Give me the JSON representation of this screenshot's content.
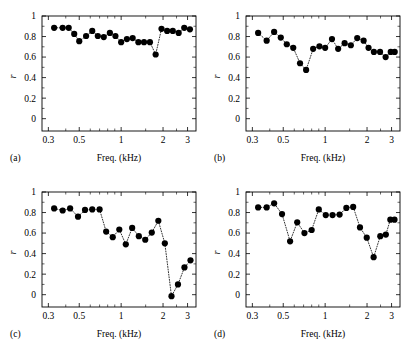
{
  "figure": {
    "panel_count": 4,
    "marker_color": "#000000",
    "line_style": "dotted",
    "background": "#ffffff"
  },
  "axes": {
    "xlabel": "Freq. (kHz)",
    "ylabel": "r",
    "x_scale": "log",
    "x_tick_labels": [
      "0.3",
      "0.5",
      "1",
      "2",
      "3"
    ],
    "x_tick_values": [
      0.3,
      0.5,
      1,
      2,
      3
    ],
    "x_minor_values": [
      0.4,
      0.6,
      0.7,
      0.8,
      0.9,
      1.5,
      2.5
    ],
    "y_tick_labels": [
      "0",
      "0.2",
      "0.4",
      "0.6",
      "0.8",
      "1"
    ],
    "y_tick_values": [
      0,
      0.2,
      0.4,
      0.6,
      0.8,
      1
    ],
    "xlim": [
      0.27,
      3.45
    ],
    "ylim": [
      -0.12,
      1.0
    ],
    "grid": false
  },
  "panels": [
    {
      "tag": "(a)",
      "name": "panel-a"
    },
    {
      "tag": "(b)",
      "name": "panel-b"
    },
    {
      "tag": "(c)",
      "name": "panel-c"
    },
    {
      "tag": "(d)",
      "name": "panel-d"
    }
  ],
  "chart_data": [
    {
      "type": "scatter",
      "title": "(a)",
      "xlabel": "Freq. (kHz)",
      "ylabel": "r",
      "xscale": "log",
      "xlim": [
        0.27,
        3.45
      ],
      "ylim": [
        -0.12,
        1.0
      ],
      "grid": false,
      "series": [
        {
          "name": "r-vs-frequency-a",
          "x": [
            0.33,
            0.38,
            0.42,
            0.46,
            0.5,
            0.56,
            0.62,
            0.68,
            0.75,
            0.83,
            0.91,
            1.0,
            1.1,
            1.21,
            1.33,
            1.46,
            1.61,
            1.77,
            1.95,
            2.14,
            2.35,
            2.59,
            2.84,
            3.12
          ],
          "y": [
            0.885,
            0.885,
            0.885,
            0.825,
            0.755,
            0.805,
            0.855,
            0.805,
            0.795,
            0.835,
            0.805,
            0.745,
            0.775,
            0.785,
            0.745,
            0.745,
            0.745,
            0.625,
            0.875,
            0.855,
            0.855,
            0.835,
            0.885,
            0.87
          ]
        }
      ]
    },
    {
      "type": "scatter",
      "title": "(b)",
      "xlabel": "Freq. (kHz)",
      "ylabel": "r",
      "xscale": "log",
      "xlim": [
        0.27,
        3.45
      ],
      "ylim": [
        -0.12,
        1.0
      ],
      "grid": false,
      "series": [
        {
          "name": "r-vs-frequency-b",
          "x": [
            0.33,
            0.38,
            0.43,
            0.48,
            0.53,
            0.59,
            0.66,
            0.73,
            0.82,
            0.91,
            1.0,
            1.12,
            1.24,
            1.38,
            1.53,
            1.7,
            1.89,
            2.05,
            2.24,
            2.48,
            2.72,
            2.96,
            3.16
          ],
          "y": [
            0.835,
            0.76,
            0.845,
            0.79,
            0.725,
            0.69,
            0.54,
            0.475,
            0.68,
            0.705,
            0.69,
            0.775,
            0.68,
            0.735,
            0.715,
            0.785,
            0.76,
            0.69,
            0.65,
            0.65,
            0.6,
            0.65,
            0.65
          ]
        }
      ]
    },
    {
      "type": "scatter",
      "title": "(c)",
      "xlabel": "Freq. (kHz)",
      "ylabel": "r",
      "xscale": "log",
      "xlim": [
        0.27,
        3.45
      ],
      "ylim": [
        -0.12,
        1.0
      ],
      "grid": false,
      "series": [
        {
          "name": "r-vs-frequency-c",
          "x": [
            0.33,
            0.38,
            0.43,
            0.49,
            0.55,
            0.62,
            0.7,
            0.78,
            0.87,
            0.97,
            1.08,
            1.2,
            1.34,
            1.49,
            1.66,
            1.85,
            2.06,
            2.3,
            2.56,
            2.85,
            3.15
          ],
          "y": [
            0.84,
            0.82,
            0.84,
            0.76,
            0.825,
            0.83,
            0.83,
            0.615,
            0.56,
            0.635,
            0.49,
            0.65,
            0.57,
            0.535,
            0.605,
            0.72,
            0.5,
            -0.015,
            0.1,
            0.265,
            0.335
          ]
        }
      ]
    },
    {
      "type": "scatter",
      "title": "(d)",
      "xlabel": "Freq. (kHz)",
      "ylabel": "r",
      "xscale": "log",
      "xlim": [
        0.27,
        3.45
      ],
      "ylim": [
        -0.12,
        1.0
      ],
      "grid": false,
      "series": [
        {
          "name": "r-vs-frequency-d",
          "x": [
            0.33,
            0.38,
            0.43,
            0.49,
            0.56,
            0.63,
            0.71,
            0.8,
            0.9,
            1.01,
            1.13,
            1.27,
            1.42,
            1.59,
            1.78,
            1.99,
            2.23,
            2.49,
            2.73,
            2.94,
            3.15
          ],
          "y": [
            0.85,
            0.85,
            0.89,
            0.785,
            0.52,
            0.705,
            0.6,
            0.63,
            0.83,
            0.775,
            0.775,
            0.78,
            0.845,
            0.855,
            0.655,
            0.555,
            0.365,
            0.57,
            0.585,
            0.73,
            0.73
          ]
        }
      ]
    }
  ]
}
